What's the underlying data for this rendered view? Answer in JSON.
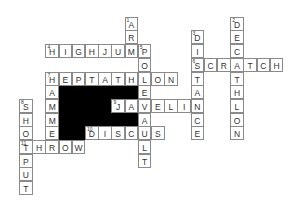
{
  "puzzle": {
    "type": "crossword",
    "grid_origin": {
      "x": 19,
      "y": 16.7
    },
    "cell_size": {
      "w": 13.2,
      "h": 13.7
    },
    "colors": {
      "border": "#8a8a8a",
      "letter": "#333333",
      "block": "#000000",
      "background": "#ffffff"
    },
    "entries": [
      {
        "number": "1",
        "word": "ARM",
        "direction": "down",
        "col": 8,
        "row": 0
      },
      {
        "number": "2",
        "word": "DECATHLON",
        "direction": "down",
        "col": 16,
        "row": 0
      },
      {
        "number": "3",
        "word": "DISTANCE",
        "direction": "down",
        "col": 13,
        "row": 1
      },
      {
        "number": "4",
        "word": "HIGHJUMP",
        "direction": "across",
        "col": 2,
        "row": 2
      },
      {
        "number": "5",
        "word": "POLE",
        "direction": "down",
        "col": 9,
        "row": 2
      },
      {
        "number": "6",
        "word": "SCRATCH",
        "direction": "across",
        "col": 13,
        "row": 3
      },
      {
        "number": "7",
        "word": "HEPTATHLON",
        "direction": "across",
        "col": 2,
        "row": 4
      },
      {
        "number": "",
        "word": "HAMMER",
        "direction": "down",
        "col": 2,
        "row": 4
      },
      {
        "number": "8",
        "word": "SHOTPUT",
        "direction": "down",
        "col": 0,
        "row": 6
      },
      {
        "number": "9",
        "word": "JAVELIN",
        "direction": "across",
        "col": 7,
        "row": 6
      },
      {
        "number": "",
        "word": "VAULT",
        "direction": "down",
        "col": 9,
        "row": 6
      },
      {
        "number": "10",
        "word": "DISCUS",
        "direction": "across",
        "col": 5,
        "row": 8
      },
      {
        "number": "11",
        "word": "THROW",
        "direction": "across",
        "col": 0,
        "row": 9
      }
    ],
    "blocks": [
      {
        "row": 5,
        "col_start": 3,
        "col_end": 8
      },
      {
        "row": 6,
        "col_start": 3,
        "col_end": 6
      },
      {
        "row": 7,
        "col_start": 3,
        "col_end": 8
      },
      {
        "row": 8,
        "col_start": 3,
        "col_end": 4
      }
    ]
  }
}
